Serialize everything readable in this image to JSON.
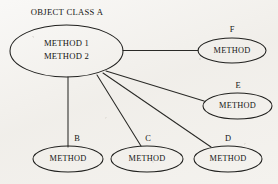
{
  "diagram": {
    "title": "OBJECT CLASS A",
    "background_color": "#f2f0ec",
    "ink_color": "#20201e",
    "main_node": {
      "id": "object-class-a",
      "line1": "METHOD 1",
      "line2": "METHOD 2"
    },
    "nodes": [
      {
        "id": "node-b",
        "label": "B",
        "text": "METHOD"
      },
      {
        "id": "node-c",
        "label": "C",
        "text": "METHOD"
      },
      {
        "id": "node-d",
        "label": "D",
        "text": "METHOD"
      },
      {
        "id": "node-e",
        "label": "E",
        "text": "METHOD"
      },
      {
        "id": "node-f",
        "label": "F",
        "text": "METHOD"
      }
    ],
    "edges": [
      {
        "id": "edge-to-b",
        "from": "object-class-a",
        "to": "node-b",
        "label": "B"
      },
      {
        "id": "edge-to-c",
        "from": "object-class-a",
        "to": "node-c",
        "label": "C"
      },
      {
        "id": "edge-to-d",
        "from": "object-class-a",
        "to": "node-d",
        "label": "D"
      },
      {
        "id": "edge-to-e",
        "from": "object-class-a",
        "to": "node-e",
        "label": "E"
      },
      {
        "id": "edge-to-f",
        "from": "object-class-a",
        "to": "node-f",
        "label": "F"
      }
    ]
  }
}
